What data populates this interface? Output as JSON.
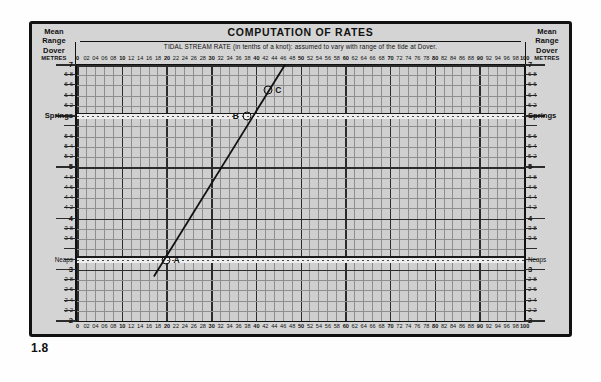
{
  "figure": {
    "number": "1.8"
  },
  "header": {
    "title": "COMPUTATION OF RATES",
    "subtitle": "TIDAL STREAM RATE (in tenths of a knot): assumed to vary with range of the tide at Dover.",
    "corner_left": {
      "line1": "Mean",
      "line2": "Range",
      "line3": "Dover"
    },
    "corner_right": {
      "line1": "Mean",
      "line2": "Range",
      "line3": "Dover"
    },
    "units_left": "METRES",
    "units_right": "METRES"
  },
  "chart_data": {
    "type": "line",
    "title": "COMPUTATION OF RATES",
    "subtitle": "TIDAL STREAM RATE (in tenths of a knot): assumed to vary with range of the tide at Dover.",
    "xlabel": "Tidal stream rate (tenths of a knot)",
    "ylabel": "Mean Range Dover (METRES)",
    "xlim": [
      0,
      100
    ],
    "ylim": [
      2,
      7
    ],
    "grid": true,
    "legend": "none",
    "x_ticks": [
      0,
      2,
      4,
      6,
      8,
      10,
      12,
      14,
      16,
      18,
      20,
      22,
      24,
      26,
      28,
      30,
      32,
      34,
      36,
      38,
      40,
      42,
      44,
      46,
      48,
      50,
      52,
      54,
      56,
      58,
      60,
      62,
      64,
      66,
      68,
      70,
      72,
      74,
      76,
      78,
      80,
      82,
      84,
      86,
      88,
      90,
      92,
      94,
      96,
      98,
      100
    ],
    "x_tick_labels": [
      "0",
      "02",
      "04",
      "06",
      "08",
      "10",
      "12",
      "14",
      "16",
      "18",
      "20",
      "22",
      "24",
      "26",
      "28",
      "30",
      "32",
      "34",
      "36",
      "38",
      "40",
      "42",
      "44",
      "46",
      "48",
      "50",
      "52",
      "54",
      "56",
      "58",
      "60",
      "62",
      "64",
      "66",
      "68",
      "70",
      "72",
      "74",
      "76",
      "78",
      "80",
      "82",
      "84",
      "86",
      "88",
      "90",
      "92",
      "94",
      "96",
      "98",
      "100"
    ],
    "x_major_ticks": [
      0,
      10,
      20,
      30,
      40,
      50,
      60,
      70,
      80,
      90,
      100
    ],
    "y_ticks": [
      2,
      2.2,
      2.4,
      2.6,
      2.8,
      3,
      3.2,
      3.4,
      3.6,
      3.8,
      4,
      4.2,
      4.4,
      4.6,
      4.8,
      5,
      5.2,
      5.4,
      5.6,
      5.8,
      6,
      6.2,
      6.4,
      6.6,
      6.8,
      7
    ],
    "y_tick_labels": [
      "2",
      "2·2",
      "2·4",
      "2·6",
      "2·8",
      "3",
      "Neaps",
      "",
      "3·6",
      "3·8",
      "4",
      "4·2",
      "4·4",
      "4·6",
      "4·8",
      "5",
      "5·2",
      "5·4",
      "5·6",
      "",
      "6",
      "6·2",
      "6·4",
      "6·6",
      "6·8",
      "7"
    ],
    "y_major_ticks": [
      2,
      3,
      4,
      5,
      6,
      7
    ],
    "reference_lines": [
      {
        "name": "Springs",
        "value": 6.0,
        "style": "dotted-band",
        "label": "Springs"
      },
      {
        "name": "Neaps",
        "value": 3.2,
        "style": "dotted-band",
        "label": "Neaps"
      }
    ],
    "series": [
      {
        "name": "construction-line",
        "type": "line",
        "points": [
          [
            17.2,
            2.87
          ],
          [
            46.5,
            7.0
          ]
        ]
      }
    ],
    "annotations": [
      {
        "label": "A",
        "x": 20.0,
        "y": 3.2,
        "marker": "circle",
        "label_side": "right"
      },
      {
        "label": "B",
        "x": 38.0,
        "y": 6.0,
        "marker": "circle",
        "label_side": "left"
      },
      {
        "label": "C",
        "x": 42.8,
        "y": 6.52,
        "marker": "circle",
        "label_side": "right"
      }
    ]
  },
  "colors": {
    "panel_bg": "#d4d4d4",
    "plot_bg": "#cfcfcf",
    "grid_minor": "#8e8e8e",
    "grid_major": "#2c2c2c",
    "ink": "#111111",
    "band": "#ededed"
  }
}
